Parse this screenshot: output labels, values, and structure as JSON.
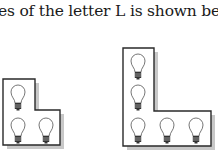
{
  "caption": "es of the letter L is shown be",
  "figures": [
    {
      "name": "small-L",
      "bulbs": 3,
      "outline": "3,79 35,79 35,110 60,110 60,145 3,145",
      "shadow": "7,83 39,83 39,114 64,114 64,149 7,149",
      "bulb_positions": [
        [
          18,
          90
        ],
        [
          18,
          123
        ],
        [
          46,
          123
        ]
      ]
    },
    {
      "name": "large-L",
      "bulbs": 5,
      "outline": "123,48 154,48 154,111 211,111 211,146 123,146",
      "shadow": "127,52 158,52 158,115 215,115 215,150 127,150",
      "bulb_positions": [
        [
          138,
          59
        ],
        [
          138,
          90
        ],
        [
          138,
          123
        ],
        [
          167,
          123
        ],
        [
          196,
          123
        ]
      ]
    }
  ],
  "colors": {
    "stroke": "#2a2a2a",
    "shadow": "#c8c8c8",
    "bulb_base": "#333333"
  }
}
